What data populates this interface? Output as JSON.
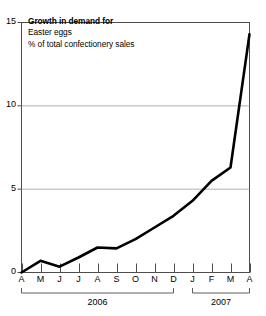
{
  "title": {
    "line1": "Growth in demand for",
    "line2": "Easter eggs",
    "line3": "% of total confectionery sales"
  },
  "axes": {
    "y_ticks": [
      "0",
      "5",
      "10",
      "15"
    ],
    "y_tick_values": [
      0,
      5,
      10,
      15
    ],
    "x_ticks": [
      "A",
      "M",
      "J",
      "J",
      "A",
      "S",
      "O",
      "N",
      "D",
      "J",
      "F",
      "M",
      "A"
    ],
    "year_groups": [
      {
        "label": "2006",
        "start_index": 0,
        "end_index": 8
      },
      {
        "label": "2007",
        "start_index": 9,
        "end_index": 12
      }
    ]
  },
  "colors": {
    "line": "#000000",
    "grid": "#a8a8a8",
    "axis": "#4d4d4d",
    "background": "#ffffff"
  },
  "chart_data": {
    "type": "line",
    "title": "Growth in demand for Easter eggs",
    "subtitle": "% of total confectionery sales",
    "xlabel": "",
    "ylabel": "% of total confectionery sales",
    "ylim": [
      0,
      15
    ],
    "yticks": [
      0,
      5,
      10,
      15
    ],
    "grid": true,
    "legend": "none",
    "x": [
      "A 2006",
      "M 2006",
      "J 2006",
      "J 2006",
      "A 2006",
      "S 2006",
      "O 2006",
      "N 2006",
      "D 2006",
      "J 2007",
      "F 2007",
      "M 2007",
      "A 2007"
    ],
    "categories": [
      "A",
      "M",
      "J",
      "J",
      "A",
      "S",
      "O",
      "N",
      "D",
      "J",
      "F",
      "M",
      "A"
    ],
    "values": [
      0.0,
      0.7,
      0.35,
      0.9,
      1.5,
      1.45,
      2.0,
      2.7,
      3.4,
      4.3,
      5.5,
      6.3,
      14.3
    ]
  }
}
